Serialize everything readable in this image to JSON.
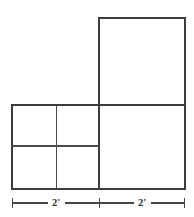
{
  "figure": {
    "type": "geometry-diagram",
    "background_color": "#ffffff",
    "stroke_color": "#3c3c42",
    "divider_color": "#4a4a50",
    "dimension_color": "#44444a",
    "shapes": [
      {
        "name": "upper-right-square",
        "x": 99,
        "y": 18,
        "width": 86,
        "height": 87
      },
      {
        "name": "lower-right-square",
        "x": 99,
        "y": 105,
        "width": 86,
        "height": 84
      },
      {
        "name": "lower-left-block",
        "x": 12,
        "y": 105,
        "width": 87,
        "height": 84
      }
    ],
    "dividers": [
      {
        "name": "lower-left-vertical-divider",
        "orientation": "vertical",
        "x1": 56,
        "y1": 105,
        "x2": 56,
        "y2": 189
      },
      {
        "name": "lower-left-horizontal-divider",
        "orientation": "horizontal",
        "x1": 12,
        "y1": 146,
        "x2": 99,
        "y2": 146
      }
    ],
    "dimension_line": {
      "name": "bottom-dimension-line",
      "y": 203,
      "x_start": 12,
      "x_end": 185,
      "ticks": [
        12,
        99,
        185
      ],
      "tick_half_height": 5,
      "segments": [
        {
          "name": "left-segment",
          "label": "2'",
          "center_x": 56,
          "from": 12,
          "to": 99
        },
        {
          "name": "right-segment",
          "label": "2'",
          "center_x": 142,
          "from": 99,
          "to": 185
        }
      ]
    }
  },
  "labels": {
    "left_dimension": "2'",
    "right_dimension": "2'"
  }
}
